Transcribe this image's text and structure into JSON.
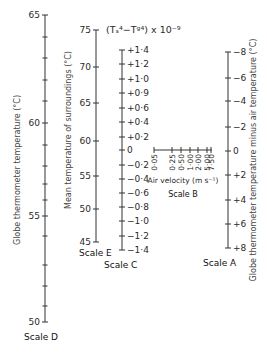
{
  "figure": {
    "type": "nomogram",
    "formula_label": "(Tₛ⁴−Tᵍ⁴) x 10⁻⁹"
  },
  "scales": {
    "D": {
      "name": "Scale D",
      "title": "Globe thermometer temperature (°C)",
      "x": 45,
      "line": [
        15,
        322
      ],
      "labels": [
        {
          "text": "65",
          "y": 15
        },
        {
          "text": "60",
          "y": 123
        },
        {
          "text": "55",
          "y": 216
        },
        {
          "text": "50",
          "y": 322
        }
      ],
      "minor_ticks": [
        37,
        58,
        80,
        101,
        145,
        166,
        184,
        200,
        236,
        265,
        286,
        306
      ]
    },
    "E": {
      "name": "Scale E",
      "title": "Mean temperature of surroundings (°C)",
      "x": 96,
      "line": [
        30,
        242
      ],
      "labels": [
        {
          "text": "75",
          "y": 30
        },
        {
          "text": "70",
          "y": 67
        },
        {
          "text": "65",
          "y": 103
        },
        {
          "text": "60",
          "y": 141
        },
        {
          "text": "55",
          "y": 176
        },
        {
          "text": "50",
          "y": 209
        },
        {
          "text": "45",
          "y": 242
        }
      ]
    },
    "C": {
      "name": "Scale C",
      "x": 122,
      "line": [
        50,
        250
      ],
      "labels": [
        {
          "text": "+1·4",
          "y": 50
        },
        {
          "text": "+1·2",
          "y": 64
        },
        {
          "text": "+1·0",
          "y": 79
        },
        {
          "text": "+0·9",
          "y": 93
        },
        {
          "text": "+0·6",
          "y": 108
        },
        {
          "text": "+0·4",
          "y": 122
        },
        {
          "text": "+0·2",
          "y": 137
        },
        {
          "text": "0",
          "y": 150
        },
        {
          "text": "−0·2",
          "y": 165
        },
        {
          "text": "−0·4",
          "y": 179
        },
        {
          "text": "−0·6",
          "y": 193
        },
        {
          "text": "−0·8",
          "y": 207
        },
        {
          "text": "−1·0",
          "y": 221
        },
        {
          "text": "−1·2",
          "y": 236
        },
        {
          "text": "−1·4",
          "y": 250
        }
      ]
    },
    "B": {
      "name": "Scale B",
      "title": "Air velocity (m s⁻¹)",
      "y": 150,
      "line": [
        154,
        212
      ],
      "labels": [
        {
          "text": "0·05",
          "x": 154
        },
        {
          "text": "0·25",
          "x": 172
        },
        {
          "text": "0·50",
          "x": 181
        },
        {
          "text": "1·00",
          "x": 190
        },
        {
          "text": "2·00",
          "x": 198
        },
        {
          "text": "5·00",
          "x": 207
        },
        {
          "text": "7·50",
          "x": 211
        }
      ]
    },
    "A": {
      "name": "Scale A",
      "title": "Globe thermometer temperature minus air temperature (°C)",
      "x": 228,
      "line": [
        52,
        248
      ],
      "labels": [
        {
          "text": "−8",
          "y": 52
        },
        {
          "text": "−6",
          "y": 78
        },
        {
          "text": "−4",
          "y": 101
        },
        {
          "text": "−2",
          "y": 127
        },
        {
          "text": "0",
          "y": 151
        },
        {
          "text": "+2",
          "y": 175
        },
        {
          "text": "+4",
          "y": 200
        },
        {
          "text": "+6",
          "y": 224
        },
        {
          "text": "+8",
          "y": 248
        }
      ]
    }
  }
}
